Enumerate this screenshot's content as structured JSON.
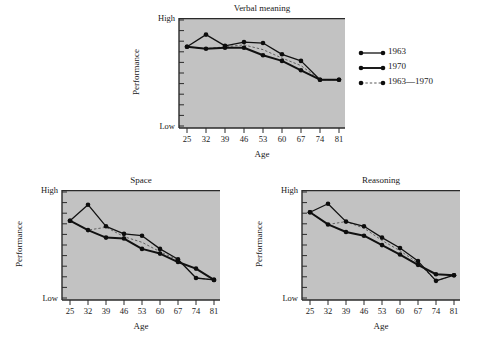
{
  "figure": {
    "background_color": "#ffffff",
    "plot_background_color": "#c2c2c2",
    "line_color": "#111111",
    "marker_color": "#0d0d0d",
    "axis_color": "#2a2a2a"
  },
  "axis_labels": {
    "y_title": "Performance",
    "y_high": "High",
    "y_low": "Low",
    "x_title": "Age"
  },
  "legend": {
    "entries": [
      {
        "label": "1963",
        "style": "solid",
        "width": 1.3
      },
      {
        "label": "1970",
        "style": "solid",
        "width": 1.9
      },
      {
        "label": "1963—1970",
        "style": "dashed",
        "width": 1.0
      }
    ]
  },
  "chart_data": [
    {
      "type": "line",
      "title": "Verbal meaning",
      "xlabel": "Age",
      "ylabel": "Performance",
      "categories": [
        25,
        32,
        39,
        46,
        53,
        60,
        67,
        74,
        81
      ],
      "x_tick_labels": [
        "25",
        "32",
        "39",
        "46",
        "53",
        "60",
        "67",
        "74",
        "81"
      ],
      "ylim": [
        0,
        100
      ],
      "y_tick_labels": [
        "Low",
        "High"
      ],
      "y_tick_count": 11,
      "grid": false,
      "series": [
        {
          "name": "1963",
          "style": "solid",
          "values": [
            80,
            93,
            81,
            85,
            84,
            72,
            65,
            45,
            45
          ]
        },
        {
          "name": "1970",
          "style": "solid",
          "values": [
            80,
            78,
            79,
            79,
            71,
            65,
            55,
            45,
            45
          ]
        },
        {
          "name": "1963—1970",
          "style": "dashed",
          "values": [
            80,
            78,
            80,
            82,
            77,
            68,
            60,
            45,
            45
          ]
        }
      ]
    },
    {
      "type": "line",
      "title": "Space",
      "xlabel": "Age",
      "ylabel": "Performance",
      "categories": [
        25,
        32,
        39,
        46,
        53,
        60,
        67,
        74,
        81
      ],
      "x_tick_labels": [
        "25",
        "32",
        "39",
        "46",
        "53",
        "60",
        "67",
        "74",
        "81"
      ],
      "ylim": [
        0,
        100
      ],
      "y_tick_labels": [
        "Low",
        "High"
      ],
      "y_tick_count": 11,
      "grid": false,
      "series": [
        {
          "name": "1963",
          "style": "solid",
          "values": [
            78,
            95,
            72,
            64,
            62,
            48,
            37,
            17,
            15
          ]
        },
        {
          "name": "1970",
          "style": "solid",
          "values": [
            78,
            68,
            60,
            59,
            48,
            43,
            34,
            27,
            15
          ]
        },
        {
          "name": "1963—1970",
          "style": "dashed",
          "values": [
            78,
            68,
            71,
            61,
            55,
            45,
            36,
            17,
            15
          ]
        }
      ]
    },
    {
      "type": "line",
      "title": "Reasoning",
      "xlabel": "Age",
      "ylabel": "Performance",
      "categories": [
        25,
        32,
        39,
        46,
        53,
        60,
        67,
        74,
        81
      ],
      "x_tick_labels": [
        "25",
        "32",
        "39",
        "46",
        "53",
        "60",
        "67",
        "74",
        "81"
      ],
      "ylim": [
        0,
        100
      ],
      "y_tick_labels": [
        "Low",
        "High"
      ],
      "y_tick_count": 11,
      "grid": false,
      "series": [
        {
          "name": "1963",
          "style": "solid",
          "values": [
            87,
            96,
            77,
            72,
            60,
            49,
            35,
            14,
            20
          ]
        },
        {
          "name": "1970",
          "style": "solid",
          "values": [
            87,
            74,
            66,
            62,
            52,
            42,
            31,
            21,
            20
          ]
        },
        {
          "name": "1963—1970",
          "style": "dashed",
          "values": [
            87,
            74,
            77,
            70,
            57,
            46,
            33,
            14,
            20
          ]
        }
      ]
    }
  ],
  "panels": [
    {
      "id": "verbal",
      "left": 179,
      "top": 18,
      "width": 166,
      "height": 110,
      "title_center": 262
    },
    {
      "id": "space",
      "left": 62,
      "top": 190,
      "width": 158,
      "height": 110,
      "title_center": 141
    },
    {
      "id": "reasoning",
      "left": 302,
      "top": 190,
      "width": 158,
      "height": 110,
      "title_center": 381
    }
  ]
}
